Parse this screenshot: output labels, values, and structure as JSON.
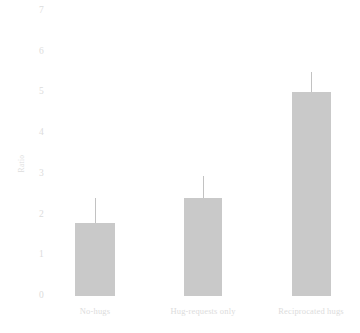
{
  "chart_data": {
    "type": "bar",
    "title": "",
    "subtitle": "",
    "xlabel": "",
    "ylabel": "Ratio",
    "categories": [
      "No-hugs",
      "Hug-requests only",
      "Reciprocated hugs"
    ],
    "values": [
      1.8,
      2.4,
      5.0
    ],
    "error_upper": [
      2.4,
      2.95,
      5.5
    ],
    "error_lower": [
      1.8,
      2.4,
      5.0
    ],
    "series": [
      {
        "name": "Ratio",
        "values": [
          1.8,
          2.4,
          5.0
        ]
      }
    ],
    "ylim": [
      0,
      7
    ],
    "xlim": [
      0,
      3
    ],
    "ytick_labels": [
      "0",
      "1",
      "2",
      "3",
      "4",
      "5",
      "6",
      "7"
    ],
    "ytick_values": [
      0,
      1,
      2,
      3,
      4,
      5,
      6,
      7
    ],
    "grid": false,
    "legend": false,
    "legend_position": "none",
    "bar_color": "#c9c9c9",
    "errorbar_color": "#c2c2c2",
    "text_color": "#dcdcdc",
    "background_color": "#ffffff",
    "annotations": []
  }
}
